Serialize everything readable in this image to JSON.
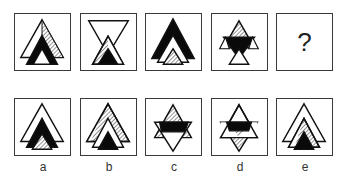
{
  "puzzle": {
    "question_mark": "?",
    "sequence": [
      {
        "id": "seq-1",
        "description": "white large triangle with right hatched half, black triangle, small white triangle"
      },
      {
        "id": "seq-2",
        "description": "inverted white triangle, hatched triangle, black triangle"
      },
      {
        "id": "seq-3",
        "description": "large black triangle, white triangle, small hatched triangle"
      },
      {
        "id": "seq-4",
        "description": "hatched upper triangle, black inverted band, white lower triangle"
      },
      {
        "id": "seq-5",
        "description": "unknown",
        "is_question": true
      }
    ],
    "options": [
      {
        "label": "a",
        "description": "white large triangle, black triangle, hatched small triangle"
      },
      {
        "label": "b",
        "description": "hatched large triangle, white triangle, black small triangle"
      },
      {
        "label": "c",
        "description": "hatched upper triangle, black band, white inverted lower triangle"
      },
      {
        "label": "d",
        "description": "white upper triangle, black band, hatched inverted lower triangle"
      },
      {
        "label": "e",
        "description": "white large triangle, hatched triangle, black small triangle"
      }
    ]
  },
  "colors": {
    "stroke": "#111111",
    "fill_black": "#0a0a0a",
    "fill_white": "#ffffff",
    "border": "#3a3a3a"
  }
}
